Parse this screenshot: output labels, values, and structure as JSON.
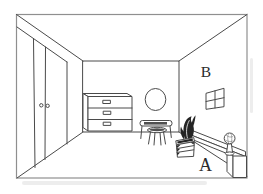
{
  "image": {
    "description": "Perspective line drawing of a room interior",
    "background_color": "#ffffff",
    "line_color": "#4a4a4a",
    "frame_color": "#8f8f8f",
    "labels": {
      "a": "A",
      "b": "B"
    },
    "objects": {
      "left_wall": "wardrobe with two doors and two round knobs",
      "back_wall_left": "dresser with three drawers and handles",
      "back_wall_right": "vanity table with round mirror and stool",
      "right_wall": "four-pane window",
      "foreground": "leafy plant in slatted planter box, long bench shelf, globe on stand, low cabinet"
    }
  }
}
